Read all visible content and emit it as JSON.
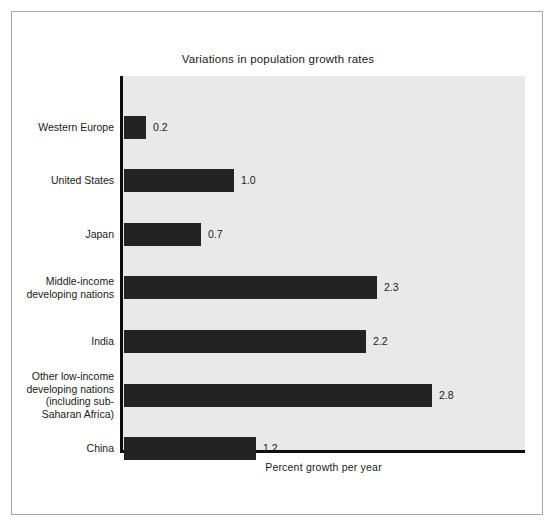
{
  "chart_data": {
    "type": "bar",
    "orientation": "horizontal",
    "title": "Variations in population growth rates",
    "xlabel": "Percent growth per year",
    "ylabel": "",
    "xlim": [
      0,
      3.6
    ],
    "grid": false,
    "legend": null,
    "categories": [
      "Western Europe",
      "United States",
      "Japan",
      "Middle-income developing nations",
      "India",
      "Other low-income developing nations (including sub-Saharan Africa)",
      "China"
    ],
    "values": [
      0.2,
      1.0,
      0.7,
      2.3,
      2.2,
      2.8,
      1.2
    ],
    "value_labels": [
      "0.2",
      "1.0",
      "0.7",
      "2.3",
      "2.2",
      "2.8",
      "1.2"
    ],
    "bar_color": "#232323",
    "plot_background": "#e9e9e9",
    "axis_color": "#0d0d0d"
  },
  "bars": [
    {
      "label_lines": [
        "Western Europe"
      ],
      "value": 0.2,
      "value_label": "0.2"
    },
    {
      "label_lines": [
        "United States"
      ],
      "value": 1.0,
      "value_label": "1.0"
    },
    {
      "label_lines": [
        "Japan"
      ],
      "value": 0.7,
      "value_label": "0.7"
    },
    {
      "label_lines": [
        "Middle-income",
        "developing nations"
      ],
      "value": 2.3,
      "value_label": "2.3"
    },
    {
      "label_lines": [
        "India"
      ],
      "value": 2.2,
      "value_label": "2.2"
    },
    {
      "label_lines": [
        "Other low-income",
        "developing nations",
        "(including sub-",
        "Saharan Africa)"
      ],
      "value": 2.8,
      "value_label": "2.8"
    },
    {
      "label_lines": [
        "China"
      ],
      "value": 1.2,
      "value_label": "1.2"
    }
  ]
}
